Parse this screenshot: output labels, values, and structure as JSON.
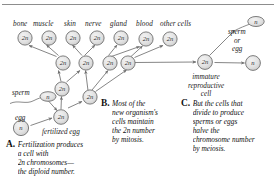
{
  "figure": {
    "title_rule": true,
    "colors": {
      "cell_fill": "#e3e3e3",
      "cell_stroke": "#6f6f6f",
      "arrow": "#707070",
      "text": "#1a1a1a"
    },
    "ploidy_diploid": "2n",
    "ploidy_haploid": "n"
  },
  "tissue_labels": [
    {
      "label": "bone"
    },
    {
      "label": "muscle"
    },
    {
      "label": "skin"
    },
    {
      "label": "nerve"
    },
    {
      "label": "gland"
    },
    {
      "label": "blood"
    },
    {
      "label": "other cells"
    }
  ],
  "cells": {
    "top_row": [
      {
        "name": "bone-cell",
        "ploidy": "2n"
      },
      {
        "name": "muscle-cell",
        "ploidy": "2n"
      },
      {
        "name": "skin-cell",
        "ploidy": "2n"
      },
      {
        "name": "nerve-cell",
        "ploidy": "2n"
      },
      {
        "name": "gland-cell",
        "ploidy": "2n"
      },
      {
        "name": "blood-cell",
        "ploidy": "2n"
      },
      {
        "name": "other-cell",
        "ploidy": "2n"
      }
    ],
    "middle_row": [
      {
        "name": "precursor-cell-1",
        "ploidy": "2n"
      },
      {
        "name": "precursor-cell-2",
        "ploidy": "2n"
      },
      {
        "name": "precursor-cell-3",
        "ploidy": "2n"
      },
      {
        "name": "precursor-cell-4",
        "ploidy": "2n"
      }
    ],
    "lower": [
      {
        "name": "early-cell-left",
        "ploidy": "2n"
      },
      {
        "name": "early-cell-right",
        "ploidy": "2n"
      }
    ],
    "fertilized_egg": {
      "ploidy": "2n"
    },
    "sperm_gamete": {
      "ploidy": "n"
    },
    "egg_gamete": {
      "ploidy": "n"
    },
    "immature_reproductive": {
      "ploidy": "2n"
    },
    "sperm_product": {
      "ploidy": "n"
    },
    "egg_product": {
      "ploidy": "n"
    }
  },
  "annotations": {
    "sperm": "sperm",
    "egg": "egg",
    "fertilized_egg": "fertilized egg",
    "sperm_or_egg": [
      "sperm",
      "or",
      "egg"
    ],
    "immature_reproductive_cell": [
      "immature",
      "reproductive",
      "cell"
    ]
  },
  "captions": [
    {
      "letter": "A.",
      "lines": [
        "Fertilization produces",
        "a cell with",
        "2n chromosomes—",
        "the diploid number."
      ]
    },
    {
      "letter": "B.",
      "lines": [
        "Most of the",
        "new organism's",
        "cells maintain",
        "the 2n number",
        "by mitosis."
      ]
    },
    {
      "letter": "C.",
      "lines": [
        "But the cells that",
        "divide to produce",
        "sperms or eggs",
        "halve the",
        "chromosome number",
        "by meiosis."
      ]
    }
  ]
}
